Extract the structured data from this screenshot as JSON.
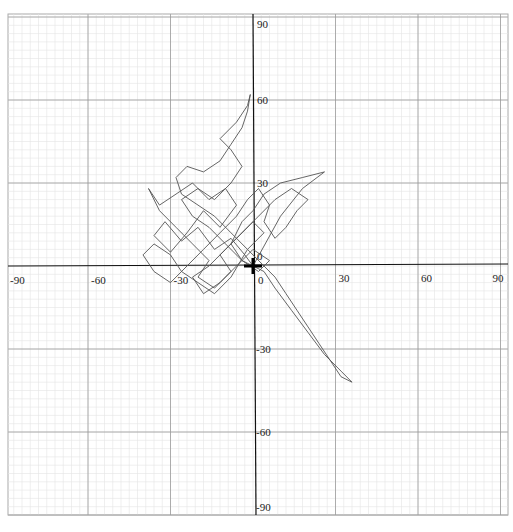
{
  "chart_data": {
    "type": "line",
    "title": "",
    "xlabel": "",
    "ylabel": "",
    "xlim": [
      -90,
      90
    ],
    "ylim": [
      -90,
      90
    ],
    "grid": true,
    "grid_major_step": 30,
    "grid_minor_step": 3,
    "legend": null,
    "x_ticks": [
      -90,
      -60,
      -30,
      0,
      30,
      60,
      90
    ],
    "y_ticks": [
      90,
      60,
      30,
      0,
      -30,
      -60,
      -90
    ],
    "x_tick_labels": [
      "-90",
      "-60",
      "-30",
      "0",
      "30",
      "60",
      "90"
    ],
    "y_tick_labels": [
      "90",
      "60",
      "30",
      "0",
      "-30",
      "-60",
      "-90"
    ],
    "origin_label": "0",
    "series": [
      {
        "name": "trajectory",
        "color": "#555555",
        "points": [
          [
            0,
            0
          ],
          [
            -3,
            4
          ],
          [
            -8,
            10
          ],
          [
            -14,
            6
          ],
          [
            -20,
            14
          ],
          [
            -26,
            9
          ],
          [
            -32,
            16
          ],
          [
            -36,
            11
          ],
          [
            -30,
            5
          ],
          [
            -24,
            12
          ],
          [
            -18,
            20
          ],
          [
            -12,
            14
          ],
          [
            -6,
            22
          ],
          [
            -10,
            28
          ],
          [
            -16,
            24
          ],
          [
            -22,
            30
          ],
          [
            -28,
            26
          ],
          [
            -34,
            22
          ],
          [
            -38,
            28
          ],
          [
            -34,
            20
          ],
          [
            -28,
            14
          ],
          [
            -22,
            8
          ],
          [
            -16,
            2
          ],
          [
            -20,
            -4
          ],
          [
            -14,
            -8
          ],
          [
            -8,
            -2
          ],
          [
            -12,
            4
          ],
          [
            -6,
            10
          ],
          [
            0,
            16
          ],
          [
            4,
            12
          ],
          [
            -2,
            6
          ],
          [
            -8,
            -4
          ],
          [
            -14,
            -10
          ],
          [
            -20,
            -6
          ],
          [
            -26,
            -2
          ],
          [
            -30,
            4
          ],
          [
            -36,
            8
          ],
          [
            -40,
            4
          ],
          [
            -36,
            -2
          ],
          [
            -30,
            -6
          ],
          [
            -24,
            0
          ],
          [
            -18,
            6
          ],
          [
            -12,
            12
          ],
          [
            -6,
            18
          ],
          [
            -2,
            24
          ],
          [
            2,
            28
          ],
          [
            6,
            22
          ],
          [
            4,
            16
          ],
          [
            8,
            10
          ],
          [
            12,
            14
          ],
          [
            16,
            20
          ],
          [
            20,
            24
          ],
          [
            14,
            28
          ],
          [
            8,
            24
          ],
          [
            2,
            18
          ],
          [
            -4,
            12
          ],
          [
            -10,
            6
          ],
          [
            -16,
            0
          ],
          [
            -22,
            -4
          ],
          [
            -18,
            -10
          ],
          [
            -12,
            -6
          ],
          [
            -6,
            0
          ],
          [
            0,
            6
          ],
          [
            6,
            2
          ],
          [
            2,
            -2
          ],
          [
            -4,
            2
          ],
          [
            -10,
            8
          ],
          [
            -16,
            14
          ],
          [
            -22,
            18
          ],
          [
            -26,
            24
          ],
          [
            -20,
            28
          ],
          [
            -14,
            24
          ],
          [
            -8,
            30
          ],
          [
            -4,
            36
          ],
          [
            -8,
            42
          ],
          [
            -12,
            46
          ],
          [
            -6,
            52
          ],
          [
            -2,
            58
          ],
          [
            -1,
            62
          ],
          [
            -2,
            56
          ],
          [
            -4,
            50
          ],
          [
            -8,
            44
          ],
          [
            -12,
            38
          ],
          [
            -18,
            34
          ],
          [
            -24,
            36
          ],
          [
            -28,
            32
          ],
          [
            -26,
            26
          ],
          [
            -20,
            22
          ],
          [
            -14,
            18
          ],
          [
            -8,
            12
          ],
          [
            -2,
            6
          ],
          [
            4,
            0
          ],
          [
            8,
            -4
          ],
          [
            12,
            -10
          ],
          [
            16,
            -16
          ],
          [
            20,
            -22
          ],
          [
            24,
            -28
          ],
          [
            28,
            -34
          ],
          [
            32,
            -40
          ],
          [
            36,
            -42
          ],
          [
            32,
            -38
          ],
          [
            26,
            -32
          ],
          [
            20,
            -24
          ],
          [
            14,
            -16
          ],
          [
            8,
            -8
          ],
          [
            4,
            -2
          ],
          [
            0,
            0
          ],
          [
            10,
            18
          ],
          [
            18,
            28
          ],
          [
            26,
            34
          ],
          [
            18,
            32
          ],
          [
            10,
            30
          ],
          [
            4,
            26
          ],
          [
            0,
            20
          ],
          [
            -4,
            16
          ],
          [
            -8,
            8
          ],
          [
            -4,
            2
          ],
          [
            0,
            0
          ]
        ]
      }
    ]
  },
  "axes": {
    "x_labels": [
      "-90",
      "-60",
      "-30",
      "0",
      "30",
      "60",
      "90"
    ],
    "y_labels": [
      "90",
      "60",
      "30",
      "0",
      "-30",
      "-60",
      "-90"
    ]
  }
}
